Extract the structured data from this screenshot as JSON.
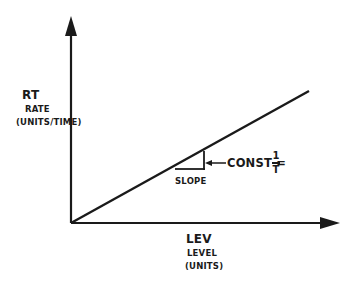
{
  "diagram": {
    "y_axis": {
      "symbol": "RT",
      "name": "RATE",
      "units": "(UNITS/TIME)"
    },
    "x_axis": {
      "symbol": "LEV",
      "name": "LEVEL",
      "units": "(UNITS)"
    },
    "slope_label": "SLOPE",
    "const_label": "CONST =",
    "const_numerator": "1",
    "const_denominator": "T",
    "colors": {
      "ink": "#1a1a1a",
      "background": "#ffffff"
    }
  }
}
